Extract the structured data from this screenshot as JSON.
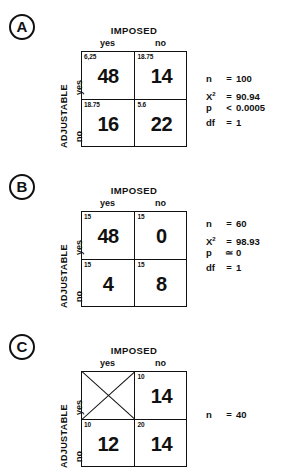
{
  "figure": {
    "column_group_label": "IMPOSED",
    "row_group_label": "ADJUSTABLE",
    "column_headers": [
      "yes",
      "no"
    ],
    "row_headers": [
      "yes",
      "no"
    ]
  },
  "panels": [
    {
      "letter": "A",
      "cells": [
        {
          "expected": "6,25",
          "observed": "48",
          "crossed": false
        },
        {
          "expected": "18.75",
          "observed": "14",
          "crossed": false
        },
        {
          "expected": "18.75",
          "observed": "16",
          "crossed": false
        },
        {
          "expected": "5.6",
          "observed": "22",
          "crossed": false
        }
      ],
      "stats": [
        {
          "label": "n",
          "sup": "",
          "op": "=",
          "value": "100"
        },
        {
          "label": "X",
          "sup": "2",
          "op": "=",
          "value": "90.94"
        },
        {
          "label": "p",
          "sup": "",
          "op": "<",
          "value": "0.0005"
        },
        {
          "label": "df",
          "sup": "",
          "op": "=",
          "value": "1"
        }
      ]
    },
    {
      "letter": "B",
      "cells": [
        {
          "expected": "15",
          "observed": "48",
          "crossed": false
        },
        {
          "expected": "15",
          "observed": "0",
          "crossed": false
        },
        {
          "expected": "15",
          "observed": "4",
          "crossed": false
        },
        {
          "expected": "15",
          "observed": "8",
          "crossed": false
        }
      ],
      "stats": [
        {
          "label": "n",
          "sup": "",
          "op": "=",
          "value": "60"
        },
        {
          "label": "X",
          "sup": "2",
          "op": "=",
          "value": "98.93"
        },
        {
          "label": "p",
          "sup": "",
          "op": "≃",
          "value": "0"
        },
        {
          "label": "df",
          "sup": "",
          "op": "=",
          "value": "1"
        }
      ]
    },
    {
      "letter": "C",
      "cells": [
        {
          "expected": "",
          "observed": "",
          "crossed": true
        },
        {
          "expected": "10",
          "observed": "14",
          "crossed": false
        },
        {
          "expected": "10",
          "observed": "12",
          "crossed": false
        },
        {
          "expected": "20",
          "observed": "14",
          "crossed": false
        }
      ],
      "stats": [
        {
          "label": "n",
          "sup": "",
          "op": "=",
          "value": "40"
        }
      ]
    }
  ]
}
